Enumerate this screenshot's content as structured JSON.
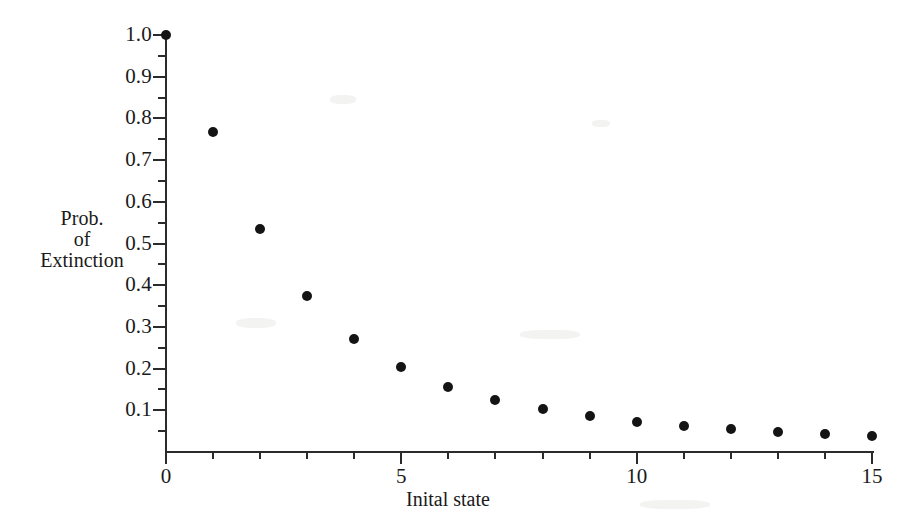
{
  "chart_data": {
    "type": "scatter",
    "title": "",
    "xlabel": "Inital state",
    "ylabel": "Prob.\nof\nExtinction",
    "ylabel_lines": [
      "Prob.",
      "of",
      "Extinction"
    ],
    "x": [
      0,
      1,
      2,
      3,
      4,
      5,
      6,
      7,
      8,
      9,
      10,
      11,
      12,
      13,
      14,
      15
    ],
    "values": [
      1.0,
      0.768,
      0.535,
      0.374,
      0.27,
      0.205,
      0.157,
      0.125,
      0.103,
      0.086,
      0.073,
      0.063,
      0.055,
      0.048,
      0.044,
      0.038
    ],
    "xlim": [
      0,
      15
    ],
    "ylim": [
      0,
      1.0
    ],
    "xticks": [
      0,
      5,
      10,
      15
    ],
    "xtick_labels": [
      "0",
      "5",
      "10",
      "15"
    ],
    "xticks_minor": [
      1,
      2,
      3,
      4,
      6,
      7,
      8,
      9,
      11,
      12,
      13,
      14
    ],
    "yticks": [
      0.1,
      0.2,
      0.3,
      0.4,
      0.5,
      0.6,
      0.7,
      0.8,
      0.9,
      1.0
    ],
    "ytick_labels": [
      "0.1",
      "0.2",
      "0.3",
      "0.4",
      "0.5",
      "0.6",
      "0.7",
      "0.8",
      "0.9",
      "1.0"
    ],
    "yticks_minor": [
      0.05,
      0.15,
      0.25,
      0.35,
      0.45,
      0.55,
      0.65,
      0.75,
      0.85,
      0.95
    ],
    "grid": false,
    "legend": false,
    "marker": "filled-circle",
    "marker_color": "#141414",
    "axis_color": "#2b2b2b",
    "background_color": "#ffffff"
  }
}
